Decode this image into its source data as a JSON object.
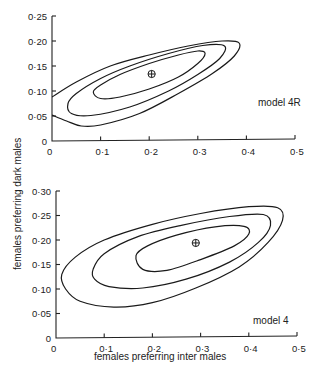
{
  "chart_data": [
    {
      "type": "contour",
      "panel": "top",
      "annotation": "model 4R",
      "xlabel": "females preferring inter males",
      "ylabel": "females preferring dark males",
      "xlim": [
        0,
        0.5
      ],
      "ylim": [
        0,
        0.25
      ],
      "x_ticks": [
        "0",
        "0·1",
        "0·2",
        "0·3",
        "0·4",
        "0·5"
      ],
      "x_tick_values": [
        0,
        0.1,
        0.2,
        0.3,
        0.4,
        0.5
      ],
      "y_ticks": [
        "0",
        "0·05",
        "0·10",
        "0·15",
        "0·20",
        "0·25"
      ],
      "y_tick_values": [
        0,
        0.05,
        0.1,
        0.15,
        0.2,
        0.25
      ],
      "grid": false,
      "maximum_marker": {
        "x": 0.205,
        "y": 0.134,
        "symbol": "circled-plus"
      },
      "contours": [
        {
          "name": "inner",
          "points": [
            [
              0.085,
              0.098
            ],
            [
              0.1,
              0.112
            ],
            [
              0.14,
              0.133
            ],
            [
              0.2,
              0.155
            ],
            [
              0.26,
              0.172
            ],
            [
              0.3,
              0.18
            ],
            [
              0.315,
              0.175
            ],
            [
              0.3,
              0.155
            ],
            [
              0.26,
              0.128
            ],
            [
              0.2,
              0.104
            ],
            [
              0.14,
              0.088
            ],
            [
              0.1,
              0.085
            ],
            [
              0.085,
              0.098
            ]
          ]
        },
        {
          "name": "middle",
          "points": [
            [
              0.033,
              0.075
            ],
            [
              0.05,
              0.095
            ],
            [
              0.1,
              0.125
            ],
            [
              0.16,
              0.15
            ],
            [
              0.24,
              0.175
            ],
            [
              0.31,
              0.191
            ],
            [
              0.355,
              0.19
            ],
            [
              0.345,
              0.165
            ],
            [
              0.3,
              0.133
            ],
            [
              0.24,
              0.1
            ],
            [
              0.16,
              0.068
            ],
            [
              0.08,
              0.051
            ],
            [
              0.04,
              0.055
            ],
            [
              0.033,
              0.075
            ]
          ]
        },
        {
          "name": "outer",
          "points": [
            [
              0.0,
              0.088
            ],
            [
              0.05,
              0.118
            ],
            [
              0.12,
              0.15
            ],
            [
              0.2,
              0.172
            ],
            [
              0.28,
              0.19
            ],
            [
              0.35,
              0.2
            ],
            [
              0.385,
              0.196
            ],
            [
              0.375,
              0.17
            ],
            [
              0.33,
              0.135
            ],
            [
              0.26,
              0.095
            ],
            [
              0.18,
              0.055
            ],
            [
              0.1,
              0.032
            ],
            [
              0.06,
              0.03
            ],
            [
              0.03,
              0.04
            ],
            [
              0.0,
              0.052
            ]
          ]
        }
      ]
    },
    {
      "type": "contour",
      "panel": "bottom",
      "annotation": "model 4",
      "xlabel": "females preferring inter males",
      "ylabel": "females preferring dark males",
      "xlim": [
        0,
        0.5
      ],
      "ylim": [
        0,
        0.3
      ],
      "x_ticks": [
        "0",
        "0·1",
        "0·2",
        "0·3",
        "0·4",
        "0·5"
      ],
      "x_tick_values": [
        0,
        0.1,
        0.2,
        0.3,
        0.4,
        0.5
      ],
      "y_ticks": [
        "0",
        "0·05",
        "0·10",
        "0·15",
        "0·20",
        "0·25",
        "0·30"
      ],
      "y_tick_values": [
        0,
        0.05,
        0.1,
        0.15,
        0.2,
        0.25,
        0.3
      ],
      "grid": false,
      "maximum_marker": {
        "x": 0.29,
        "y": 0.194,
        "symbol": "circled-plus"
      },
      "contours": [
        {
          "name": "inner",
          "points": [
            [
              0.166,
              0.168
            ],
            [
              0.19,
              0.188
            ],
            [
              0.25,
              0.21
            ],
            [
              0.33,
              0.227
            ],
            [
              0.39,
              0.228
            ],
            [
              0.4,
              0.212
            ],
            [
              0.37,
              0.188
            ],
            [
              0.3,
              0.16
            ],
            [
              0.23,
              0.138
            ],
            [
              0.18,
              0.14
            ],
            [
              0.166,
              0.168
            ]
          ]
        },
        {
          "name": "middle",
          "points": [
            [
              0.077,
              0.14
            ],
            [
              0.1,
              0.172
            ],
            [
              0.17,
              0.207
            ],
            [
              0.26,
              0.23
            ],
            [
              0.36,
              0.248
            ],
            [
              0.43,
              0.252
            ],
            [
              0.445,
              0.23
            ],
            [
              0.42,
              0.195
            ],
            [
              0.36,
              0.155
            ],
            [
              0.27,
              0.12
            ],
            [
              0.18,
              0.102
            ],
            [
              0.11,
              0.105
            ],
            [
              0.08,
              0.12
            ],
            [
              0.077,
              0.14
            ]
          ]
        },
        {
          "name": "outer",
          "points": [
            [
              0.012,
              0.13
            ],
            [
              0.04,
              0.165
            ],
            [
              0.1,
              0.2
            ],
            [
              0.2,
              0.232
            ],
            [
              0.3,
              0.254
            ],
            [
              0.4,
              0.268
            ],
            [
              0.46,
              0.266
            ],
            [
              0.47,
              0.24
            ],
            [
              0.44,
              0.195
            ],
            [
              0.38,
              0.145
            ],
            [
              0.29,
              0.102
            ],
            [
              0.2,
              0.072
            ],
            [
              0.12,
              0.063
            ],
            [
              0.05,
              0.075
            ],
            [
              0.02,
              0.1
            ],
            [
              0.012,
              0.13
            ]
          ]
        }
      ]
    }
  ],
  "figure": {
    "shared_ylabel": "females preferring dark males",
    "shared_xlabel": "females preferring inter males",
    "panels": [
      {
        "model_label": "model 4R"
      },
      {
        "model_label": "model 4"
      }
    ]
  }
}
